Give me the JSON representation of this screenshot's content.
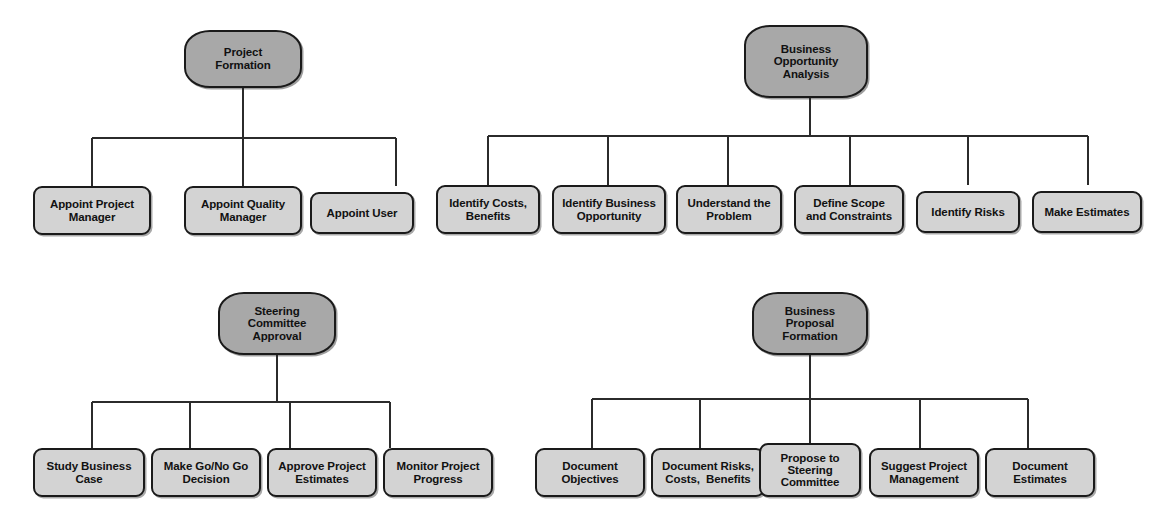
{
  "diagram": {
    "type": "hierarchical-decomposition-tree",
    "colors": {
      "background": "#ffffff",
      "parent_fill": "#a8a8a8",
      "leaf_fill": "#d3d3d3",
      "stroke": "#1a1a1a",
      "text": "#111111"
    },
    "clusters": [
      {
        "id": "project-formation",
        "parent": {
          "label": "Project Formation",
          "lines": [
            "Project",
            "Formation"
          ]
        },
        "children": [
          {
            "label": "Appoint Project Manager",
            "lines": [
              "Appoint Project",
              "Manager"
            ]
          },
          {
            "label": "Appoint Quality Manager",
            "lines": [
              "Appoint Quality",
              "Manager"
            ]
          },
          {
            "label": "Appoint User",
            "lines": [
              "Appoint User"
            ]
          }
        ]
      },
      {
        "id": "business-opportunity-analysis",
        "parent": {
          "label": "Business Opportunity Analysis",
          "lines": [
            "Business",
            "Opportunity",
            "Analysis"
          ]
        },
        "children": [
          {
            "label": "Identify Costs, Benefits",
            "lines": [
              "Identify Costs,",
              "Benefits"
            ]
          },
          {
            "label": "Identify Business Opportunity",
            "lines": [
              "Identify Business",
              "Opportunity"
            ]
          },
          {
            "label": "Understand the Problem",
            "lines": [
              "Understand the",
              "Problem"
            ]
          },
          {
            "label": "Define Scope and Constraints",
            "lines": [
              "Define Scope",
              "and Constraints"
            ]
          },
          {
            "label": "Identify Risks",
            "lines": [
              "Identify Risks"
            ]
          },
          {
            "label": "Make Estimates",
            "lines": [
              "Make Estimates"
            ]
          }
        ]
      },
      {
        "id": "steering-committee-approval",
        "parent": {
          "label": "Steering Committee Approval",
          "lines": [
            "Steering",
            "Committee",
            "Approval"
          ]
        },
        "children": [
          {
            "label": "Study Business Case",
            "lines": [
              "Study Business",
              "Case"
            ]
          },
          {
            "label": "Make Go/No Go Decision",
            "lines": [
              "Make Go/No Go",
              "Decision"
            ]
          },
          {
            "label": "Approve Project Estimates",
            "lines": [
              "Approve Project",
              "Estimates"
            ]
          },
          {
            "label": "Monitor Project Progress",
            "lines": [
              "Monitor Project",
              "Progress"
            ]
          }
        ]
      },
      {
        "id": "business-proposal-formation",
        "parent": {
          "label": "Business Proposal Formation",
          "lines": [
            "Business",
            "Proposal",
            "Formation"
          ]
        },
        "children": [
          {
            "label": "Document Objectives",
            "lines": [
              "Document",
              "Objectives"
            ]
          },
          {
            "label": "Document Risks, Costs,  Benefits",
            "lines": [
              "Document Risks,",
              "Costs,  Benefits"
            ]
          },
          {
            "label": "Propose to Steering Committee",
            "lines": [
              "Propose to",
              "Steering",
              "Committee"
            ]
          },
          {
            "label": "Suggest Project Management",
            "lines": [
              "Suggest Project",
              "Management"
            ]
          },
          {
            "label": "Document Estimates",
            "lines": [
              "Document",
              "Estimates"
            ]
          }
        ]
      }
    ]
  }
}
